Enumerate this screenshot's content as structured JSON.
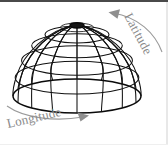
{
  "figure": {
    "background_color": "#ffffff",
    "wire_color": "#111111",
    "annotation_color": "#8a8a8a",
    "width": 168,
    "height": 145
  },
  "annotations": {
    "latitude": {
      "label": "Latitude",
      "position": "upper-right",
      "arrow_direction": "counter-clockwise-up-left",
      "text_rotation_deg": 62
    },
    "longitude": {
      "label": "Longitude",
      "position": "lower-left",
      "arrow_direction": "clockwise-right",
      "text_rotation_deg": -13
    }
  },
  "geometry": {
    "shape": "hemisphere-dome",
    "center_x": 77,
    "base_y": 96,
    "radius_x": 64,
    "radius_y": 17,
    "apex_y": 25,
    "meridian_count": 16,
    "parallel_count": 6,
    "parallel_latitudes_deg": [
      0,
      15,
      30,
      45,
      60,
      75
    ]
  }
}
